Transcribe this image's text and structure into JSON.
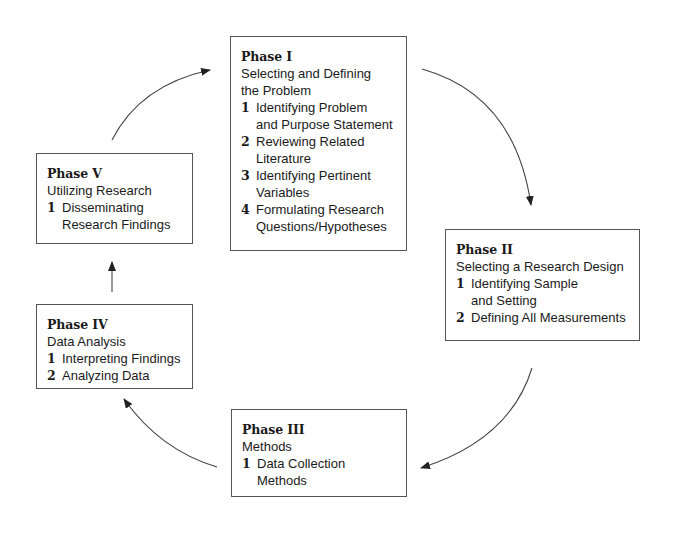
{
  "diagram": {
    "type": "cycle",
    "phases": [
      {
        "title": "Phase I",
        "subtitle": "Selecting and Defining\nthe Problem",
        "steps": [
          {
            "num": "1",
            "text": "Identifying Problem\nand Purpose Statement"
          },
          {
            "num": "2",
            "text": "Reviewing Related\nLiterature"
          },
          {
            "num": "3",
            "text": "Identifying Pertinent\nVariables"
          },
          {
            "num": "4",
            "text": "Formulating Research\nQuestions/Hypotheses"
          }
        ]
      },
      {
        "title": "Phase II",
        "subtitle": "Selecting a Research Design",
        "steps": [
          {
            "num": "1",
            "text": "Identifying Sample\nand Setting"
          },
          {
            "num": "2",
            "text": "Defining All Measurements"
          }
        ]
      },
      {
        "title": "Phase III",
        "subtitle": "Methods",
        "steps": [
          {
            "num": "1",
            "text": "Data Collection\nMethods"
          }
        ]
      },
      {
        "title": "Phase IV",
        "subtitle": "Data Analysis",
        "steps": [
          {
            "num": "1",
            "text": "Interpreting Findings"
          },
          {
            "num": "2",
            "text": "Analyzing Data"
          }
        ]
      },
      {
        "title": "Phase V",
        "subtitle": "Utilizing Research",
        "steps": [
          {
            "num": "1",
            "text": "Disseminating\nResearch Findings"
          }
        ]
      }
    ],
    "edges": [
      {
        "from": "Phase I",
        "to": "Phase II",
        "style": "curved"
      },
      {
        "from": "Phase II",
        "to": "Phase III",
        "style": "curved"
      },
      {
        "from": "Phase III",
        "to": "Phase IV",
        "style": "curved"
      },
      {
        "from": "Phase IV",
        "to": "Phase V",
        "style": "straight"
      },
      {
        "from": "Phase V",
        "to": "Phase I",
        "style": "curved"
      }
    ],
    "colors": {
      "line": "#444444",
      "text": "#1a1a1a",
      "background": "#ffffff"
    }
  }
}
